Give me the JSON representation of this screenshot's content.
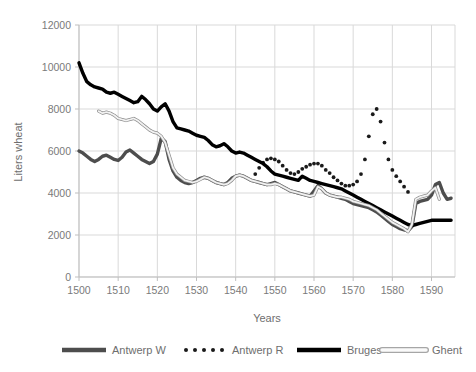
{
  "chart_data": {
    "type": "line",
    "title": "",
    "xlabel": "Years",
    "ylabel": "Liters wheat",
    "xlim": [
      1500,
      1596
    ],
    "ylim": [
      0,
      12000
    ],
    "xticks": [
      "1500",
      "1510",
      "1520",
      "1530",
      "1540",
      "1550",
      "1560",
      "1570",
      "1580",
      "1590"
    ],
    "xtick_values": [
      1500,
      1510,
      1520,
      1530,
      1540,
      1550,
      1560,
      1570,
      1580,
      1590
    ],
    "yticks": [
      "0",
      "2000",
      "4000",
      "6000",
      "8000",
      "10000",
      "12000"
    ],
    "ytick_values": [
      0,
      2000,
      4000,
      6000,
      8000,
      10000,
      12000
    ],
    "grid": true,
    "legend_position": "bottom",
    "series": [
      {
        "name": "Antwerp W",
        "style": "solid-thick",
        "color": "#4d4d4d",
        "x": [
          1500,
          1501,
          1502,
          1503,
          1504,
          1505,
          1506,
          1507,
          1508,
          1509,
          1510,
          1511,
          1512,
          1513,
          1514,
          1515,
          1516,
          1517,
          1518,
          1519,
          1520,
          1521,
          1522,
          1523,
          1524,
          1525,
          1526,
          1527,
          1528,
          1529,
          1530,
          1531,
          1532,
          1533,
          1534,
          1535,
          1536,
          1537,
          1538,
          1539,
          1540,
          1541,
          1542,
          1543,
          1544,
          1545,
          1546,
          1547,
          1548,
          1549,
          1550,
          1551,
          1552,
          1553,
          1554,
          1555,
          1556,
          1557,
          1558,
          1559,
          1560,
          1561,
          1562,
          1563,
          1564,
          1565,
          1566,
          1567,
          1568,
          1569,
          1570,
          1571,
          1572,
          1573,
          1574,
          1575,
          1576,
          1577,
          1578,
          1579,
          1580,
          1581,
          1582,
          1583,
          1584,
          1585,
          1586,
          1587,
          1588,
          1589,
          1590,
          1591,
          1592,
          1593,
          1594,
          1595
        ],
        "values": [
          6000,
          5900,
          5750,
          5600,
          5500,
          5600,
          5750,
          5800,
          5700,
          5600,
          5550,
          5700,
          5950,
          6050,
          5900,
          5750,
          5600,
          5500,
          5400,
          5500,
          5850,
          6600,
          6450,
          5600,
          5050,
          4750,
          4600,
          4500,
          4450,
          4500,
          4600,
          4700,
          4750,
          4700,
          4600,
          4500,
          4450,
          4400,
          4500,
          4700,
          4800,
          4850,
          4800,
          4700,
          4600,
          4550,
          4500,
          4450,
          4400,
          4450,
          4500,
          4400,
          4300,
          4200,
          4100,
          4050,
          4000,
          3950,
          3900,
          3850,
          4100,
          4350,
          4200,
          4000,
          3900,
          3850,
          3800,
          3750,
          3700,
          3600,
          3500,
          3450,
          3400,
          3350,
          3300,
          3200,
          3100,
          2950,
          2800,
          2650,
          2500,
          2400,
          2300,
          2250,
          2200,
          2400,
          3500,
          3600,
          3650,
          3700,
          3900,
          4400,
          4500,
          4000,
          3700,
          3750
        ]
      },
      {
        "name": "Antwerp R",
        "style": "dotted",
        "color": "#1a1a1a",
        "x": [
          1545,
          1546,
          1547,
          1548,
          1549,
          1550,
          1551,
          1552,
          1553,
          1554,
          1555,
          1556,
          1557,
          1558,
          1559,
          1560,
          1561,
          1562,
          1563,
          1564,
          1565,
          1566,
          1567,
          1568,
          1569,
          1570,
          1571,
          1572,
          1573,
          1574,
          1575,
          1576,
          1577,
          1578,
          1579,
          1580,
          1581,
          1582,
          1583,
          1584
        ],
        "values": [
          4900,
          5200,
          5450,
          5600,
          5650,
          5600,
          5500,
          5300,
          5100,
          4950,
          4900,
          5000,
          5150,
          5250,
          5350,
          5400,
          5400,
          5300,
          5100,
          4950,
          4750,
          4600,
          4450,
          4350,
          4350,
          4400,
          4550,
          4900,
          5600,
          6700,
          7750,
          8000,
          7400,
          6400,
          5600,
          5100,
          4800,
          4550,
          4300,
          4050
        ]
      },
      {
        "name": "Bruges",
        "style": "solid-thick",
        "color": "#000000",
        "x": [
          1500,
          1501,
          1502,
          1503,
          1504,
          1505,
          1506,
          1507,
          1508,
          1509,
          1510,
          1511,
          1512,
          1513,
          1514,
          1515,
          1516,
          1517,
          1518,
          1519,
          1520,
          1521,
          1522,
          1523,
          1524,
          1525,
          1526,
          1527,
          1528,
          1529,
          1530,
          1531,
          1532,
          1533,
          1534,
          1535,
          1536,
          1537,
          1538,
          1539,
          1540,
          1541,
          1542,
          1543,
          1544,
          1545,
          1546,
          1547,
          1548,
          1549,
          1550,
          1551,
          1552,
          1553,
          1554,
          1555,
          1556,
          1557,
          1558,
          1559,
          1560,
          1561,
          1562,
          1563,
          1564,
          1565,
          1566,
          1567,
          1568,
          1569,
          1570,
          1571,
          1572,
          1573,
          1574,
          1575,
          1576,
          1577,
          1578,
          1579,
          1580,
          1581,
          1582,
          1583,
          1584,
          1585,
          1586,
          1587,
          1588,
          1589,
          1590,
          1591,
          1592,
          1593,
          1594,
          1595
        ],
        "values": [
          10200,
          9700,
          9300,
          9150,
          9050,
          9000,
          8950,
          8800,
          8750,
          8800,
          8700,
          8600,
          8500,
          8400,
          8300,
          8350,
          8600,
          8450,
          8250,
          8000,
          7900,
          8100,
          8250,
          7900,
          7400,
          7100,
          7050,
          7000,
          6950,
          6850,
          6750,
          6700,
          6650,
          6500,
          6300,
          6200,
          6250,
          6350,
          6200,
          6000,
          5900,
          5950,
          5900,
          5800,
          5700,
          5600,
          5500,
          5400,
          5250,
          5050,
          4900,
          4850,
          4800,
          4750,
          4700,
          4650,
          4600,
          4800,
          4700,
          4600,
          4550,
          4500,
          4450,
          4400,
          4350,
          4300,
          4250,
          4200,
          4100,
          4000,
          3900,
          3800,
          3700,
          3600,
          3500,
          3400,
          3300,
          3200,
          3100,
          3000,
          2900,
          2800,
          2700,
          2600,
          2500,
          2450,
          2500,
          2550,
          2600,
          2650,
          2700,
          2700,
          2700,
          2700,
          2700,
          2700
        ]
      },
      {
        "name": "Ghent",
        "style": "thin-outline",
        "color": "#c9c9c9",
        "x": [
          1505,
          1506,
          1507,
          1508,
          1509,
          1510,
          1511,
          1512,
          1513,
          1514,
          1515,
          1516,
          1517,
          1518,
          1519,
          1520,
          1521,
          1522,
          1523,
          1524,
          1525,
          1526,
          1527,
          1528,
          1529,
          1530,
          1531,
          1532,
          1533,
          1534,
          1535,
          1536,
          1537,
          1538,
          1539,
          1540,
          1541,
          1542,
          1543,
          1544,
          1545,
          1546,
          1547,
          1548,
          1549,
          1550,
          1551,
          1552,
          1553,
          1554,
          1555,
          1556,
          1557,
          1558,
          1559,
          1560,
          1561,
          1562,
          1563,
          1564,
          1565,
          1566,
          1567,
          1568,
          1569,
          1570,
          1571,
          1572,
          1573,
          1574,
          1575,
          1576,
          1577,
          1578,
          1579,
          1580,
          1581,
          1582,
          1583,
          1584,
          1585,
          1586,
          1587,
          1588,
          1589,
          1590,
          1591,
          1592
        ],
        "values": [
          7900,
          7800,
          7850,
          7800,
          7700,
          7550,
          7500,
          7450,
          7500,
          7550,
          7450,
          7300,
          7150,
          7000,
          6900,
          6850,
          6700,
          6400,
          5800,
          5200,
          4900,
          4750,
          4600,
          4550,
          4500,
          4550,
          4650,
          4750,
          4700,
          4600,
          4500,
          4450,
          4400,
          4450,
          4600,
          4800,
          4850,
          4800,
          4700,
          4600,
          4550,
          4500,
          4450,
          4400,
          4400,
          4450,
          4400,
          4300,
          4200,
          4100,
          4050,
          4000,
          3950,
          3900,
          3850,
          3900,
          4300,
          4200,
          4000,
          3900,
          3850,
          3800,
          3800,
          3750,
          3700,
          3600,
          3550,
          3500,
          3450,
          3400,
          3300,
          3200,
          3050,
          2900,
          2750,
          2600,
          2500,
          2400,
          2300,
          2150,
          2500,
          3700,
          3800,
          3850,
          3900,
          4100,
          4250,
          3700
        ]
      }
    ]
  },
  "legend": {
    "items": [
      {
        "label": "Antwerp W",
        "marker": "thick-line-dark-gray"
      },
      {
        "label": "Antwerp R",
        "marker": "dotted-line-black"
      },
      {
        "label": "Bruges",
        "marker": "thick-line-black"
      },
      {
        "label": "Ghent",
        "marker": "outline-line-light"
      }
    ]
  },
  "colors": {
    "antwerp_w": "#4d4d4d",
    "antwerp_r": "#1a1a1a",
    "bruges": "#000000",
    "ghent": "#c9c9c9",
    "grid": "#d9d9d9",
    "text": "#7a7a7a"
  }
}
